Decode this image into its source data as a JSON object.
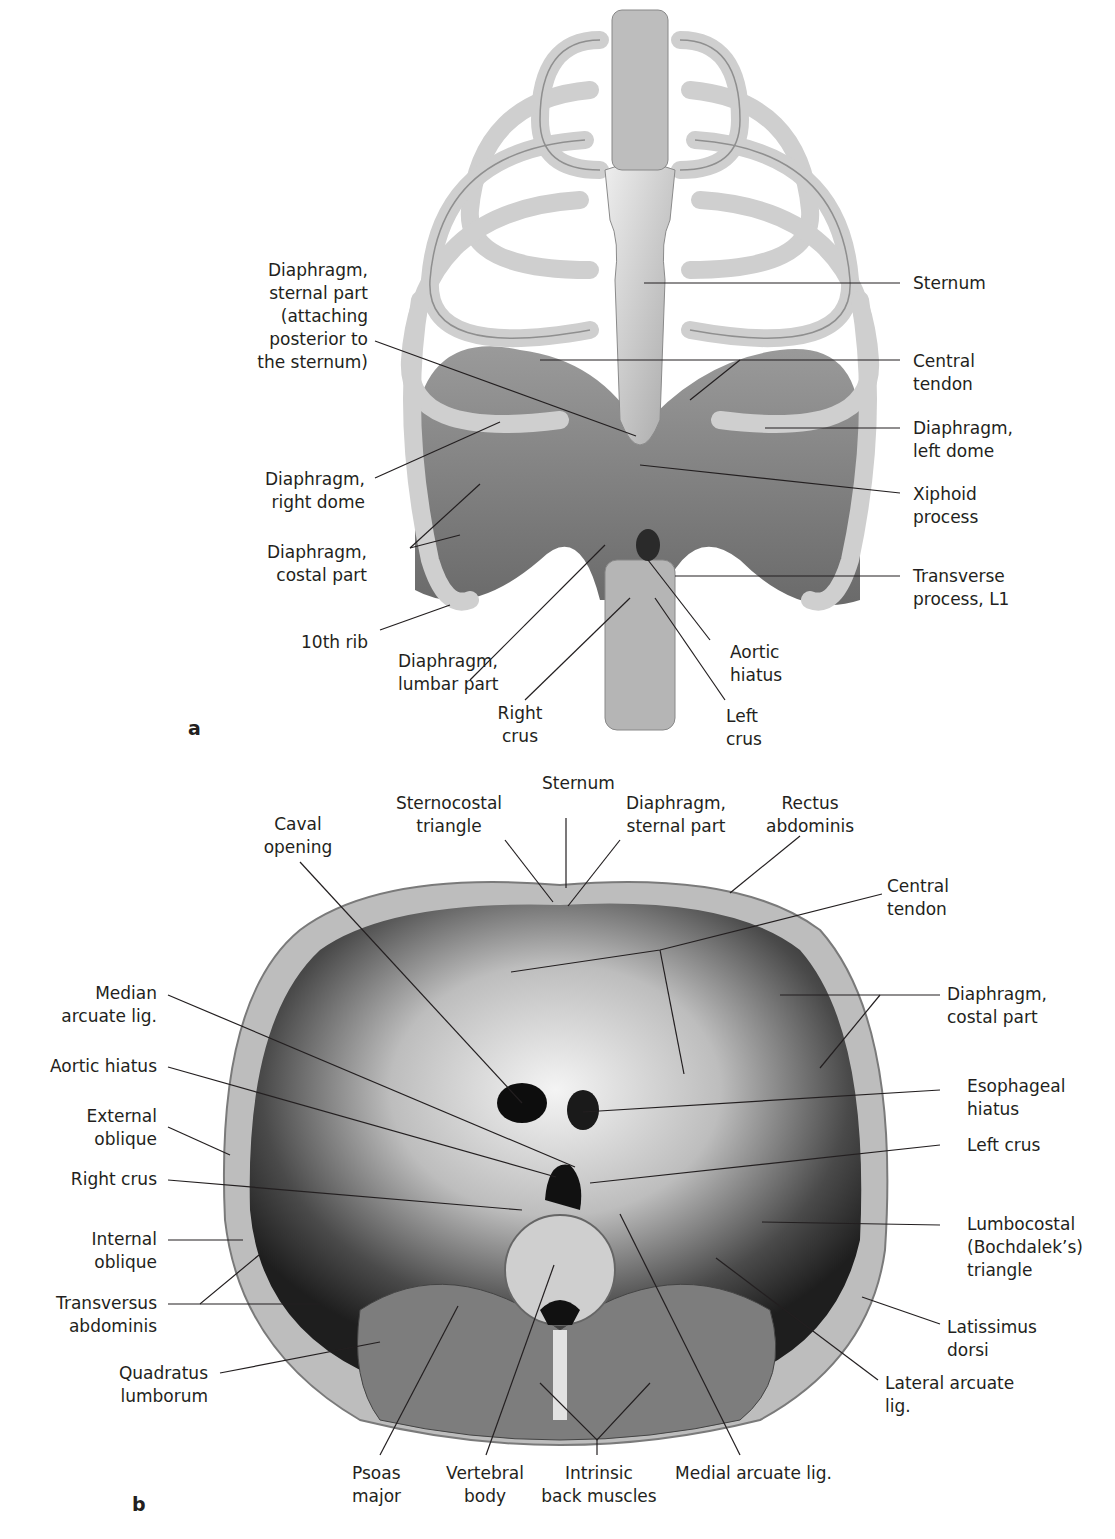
{
  "figure": {
    "panels": [
      {
        "id": "a",
        "letter": "a",
        "labels": {
          "sternum": "Sternum",
          "diaphragm_sternal_part": "Diaphragm,\nsternal part\n(attaching\nposterior to\nthe sternum)",
          "central_tendon": "Central\ntendon",
          "diaphragm_left_dome": "Diaphragm,\nleft dome",
          "diaphragm_right_dome": "Diaphragm,\nright dome",
          "xiphoid_process": "Xiphoid\nprocess",
          "diaphragm_costal_part": "Diaphragm,\ncostal part",
          "transverse_process_l1": "Transverse\nprocess, L1",
          "tenth_rib": "10th rib",
          "diaphragm_lumbar_part": "Diaphragm,\nlumbar part",
          "aortic_hiatus": "Aortic\nhiatus",
          "right_crus": "Right\ncrus",
          "left_crus": "Left\ncrus"
        }
      },
      {
        "id": "b",
        "letter": "b",
        "labels": {
          "sternum": "Sternum",
          "sternocostal_triangle": "Sternocostal\ntriangle",
          "diaphragm_sternal_part": "Diaphragm,\nsternal part",
          "rectus_abdominis": "Rectus\nabdominis",
          "caval_opening": "Caval\nopening",
          "central_tendon": "Central\ntendon",
          "median_arcuate_lig": "Median\narcuate lig.",
          "diaphragm_costal_part": "Diaphragm,\ncostal part",
          "aortic_hiatus": "Aortic hiatus",
          "esophageal_hiatus": "Esophageal\nhiatus",
          "external_oblique": "External\noblique",
          "left_crus": "Left crus",
          "right_crus": "Right crus",
          "internal_oblique": "Internal\noblique",
          "lumbocostal_triangle": "Lumbocostal\n(Bochdalek’s)\ntriangle",
          "transversus_abdominis": "Transversus\nabdominis",
          "latissimus_dorsi": "Latissimus\ndorsi",
          "quadratus_lumborum": "Quadratus\nlumborum",
          "lateral_arcuate_lig": "Lateral arcuate\nlig.",
          "psoas_major": "Psoas\nmajor",
          "vertebral_body": "Vertebral\nbody",
          "intrinsic_back_muscles": "Intrinsic\nback muscles",
          "medial_arcuate_lig": "Medial arcuate lig."
        }
      }
    ]
  }
}
